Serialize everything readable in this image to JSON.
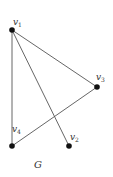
{
  "graph": {
    "name": "G",
    "vertices": [
      {
        "id": "v1",
        "label": "v",
        "sub": "1",
        "x": 12,
        "y": 30,
        "lx": 13,
        "ly": 24
      },
      {
        "id": "v2",
        "label": "v",
        "sub": "2",
        "x": 69,
        "y": 146,
        "lx": 70,
        "ly": 140
      },
      {
        "id": "v3",
        "label": "v",
        "sub": "3",
        "x": 97,
        "y": 87,
        "lx": 98,
        "ly": 81
      },
      {
        "id": "v4",
        "label": "v",
        "sub": "4",
        "x": 12,
        "y": 146,
        "lx": 13,
        "ly": 131
      }
    ],
    "edges": [
      {
        "from": "v1",
        "to": "v4"
      },
      {
        "from": "v1",
        "to": "v2"
      },
      {
        "from": "v1",
        "to": "v3"
      },
      {
        "from": "v4",
        "to": "v3"
      }
    ],
    "colors": {
      "edge": "#555555",
      "vertex": "#111111",
      "label": "#333333"
    }
  }
}
